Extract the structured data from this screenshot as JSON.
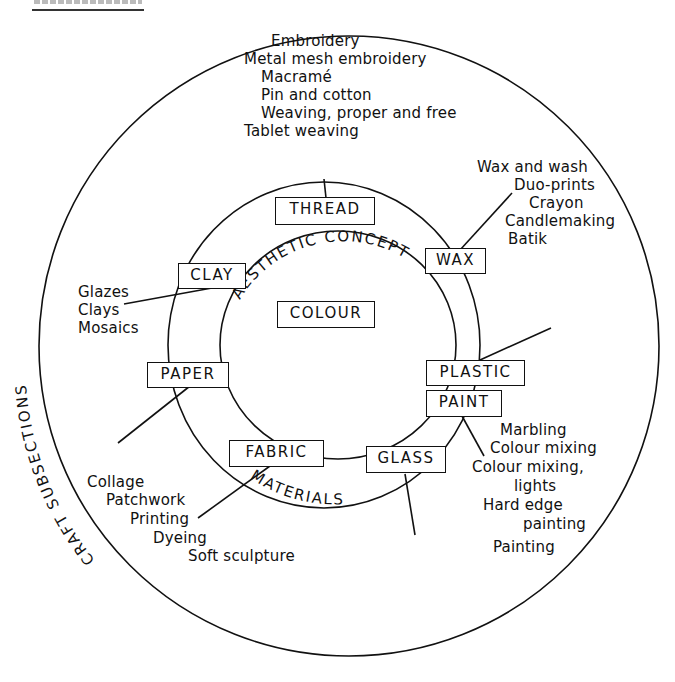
{
  "header": {
    "rule": true
  },
  "rings": {
    "outer_label": "CRAFT SUBSECTIONS",
    "middle_label": "MATERIALS",
    "inner_label": "AESTHETIC CONCEPT",
    "center": "COLOUR"
  },
  "materials": {
    "thread": "THREAD",
    "wax": "WAX",
    "clay": "CLAY",
    "paper": "PAPER",
    "plastic": "PLASTIC",
    "paint": "PAINT",
    "fabric": "FABRIC",
    "glass": "GLASS"
  },
  "subsections": {
    "thread": [
      "Embroidery",
      "Metal mesh embroidery",
      "Macramé",
      "Pin and cotton",
      "Weaving, proper and free",
      "Tablet weaving"
    ],
    "wax": [
      "Wax and wash",
      "Duo-prints",
      "Crayon",
      "Candlemaking",
      "Batik"
    ],
    "clay": [
      "Glazes",
      "Clays",
      "Mosaics"
    ],
    "paper": [
      "Collage",
      "Patchwork",
      "Printing",
      "Dyeing",
      "Soft sculpture"
    ],
    "paint": [
      "Marbling",
      "Colour mixing",
      "Colour mixing,",
      "lights",
      "Hard edge",
      "painting",
      "Painting"
    ]
  }
}
